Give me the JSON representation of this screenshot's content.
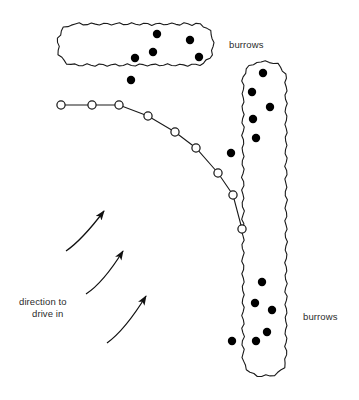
{
  "figure": {
    "title": "",
    "type": "schematic-map-diagram",
    "width": 359,
    "height": 400,
    "background_color": "#ffffff",
    "stroke_color": "#1a1a1a",
    "dot_fill_color": "#000000",
    "open_marker_fill": "#ffffff"
  },
  "labels": [
    {
      "id": "burrows-top",
      "text": "burrows",
      "x": 229,
      "y": 39,
      "align": "left"
    },
    {
      "id": "burrows-bottom",
      "text": "burrows",
      "x": 303,
      "y": 311,
      "align": "left"
    },
    {
      "id": "direction-line-1",
      "text": "direction to",
      "x": 19,
      "y": 296,
      "align": "left"
    },
    {
      "id": "direction-line-2",
      "text": "drive in",
      "x": 32,
      "y": 308,
      "align": "left"
    }
  ],
  "patches": [
    {
      "id": "burrow-patch-top",
      "name": "top-burrow-patch",
      "shape": "horizontal-rounded-blob",
      "wavy_outline": true,
      "bounds": {
        "x": 58,
        "y": 24,
        "w": 155,
        "h": 41
      }
    },
    {
      "id": "burrow-patch-right",
      "name": "right-burrow-patch",
      "shape": "vertical-rounded-blob",
      "wavy_outline": true,
      "bounds": {
        "x": 243,
        "y": 62,
        "w": 43,
        "h": 314
      }
    }
  ],
  "burrow_dots": {
    "radius": 4.2,
    "top_patch": [
      {
        "x": 157,
        "y": 34
      },
      {
        "x": 190,
        "y": 40
      },
      {
        "x": 153,
        "y": 52
      },
      {
        "x": 135,
        "y": 58
      },
      {
        "x": 199,
        "y": 57
      }
    ],
    "outside_top_patch": [
      {
        "x": 131,
        "y": 80
      }
    ],
    "right_patch_upper": [
      {
        "x": 263,
        "y": 73
      },
      {
        "x": 252,
        "y": 92
      },
      {
        "x": 270,
        "y": 107
      },
      {
        "x": 253,
        "y": 119
      },
      {
        "x": 256,
        "y": 138
      }
    ],
    "outside_right_patch": [
      {
        "x": 231,
        "y": 153
      },
      {
        "x": 232,
        "y": 341
      }
    ],
    "right_patch_lower": [
      {
        "x": 262,
        "y": 282
      },
      {
        "x": 255,
        "y": 303
      },
      {
        "x": 272,
        "y": 310
      },
      {
        "x": 267,
        "y": 332
      },
      {
        "x": 256,
        "y": 341
      }
    ]
  },
  "transect_line": {
    "id": "transect-with-open-markers",
    "marker_radius": 4.1,
    "marker_fill": "#ffffff",
    "points": [
      {
        "x": 61,
        "y": 105
      },
      {
        "x": 92,
        "y": 105
      },
      {
        "x": 119,
        "y": 105
      },
      {
        "x": 148,
        "y": 116
      },
      {
        "x": 175,
        "y": 132
      },
      {
        "x": 196,
        "y": 148
      },
      {
        "x": 218,
        "y": 173
      },
      {
        "x": 233,
        "y": 195
      },
      {
        "x": 242,
        "y": 229
      }
    ]
  },
  "direction_arrows": [
    {
      "id": "arrow-1",
      "from": {
        "x": 66,
        "y": 251
      },
      "ctrl": {
        "x": 82,
        "y": 240
      },
      "to": {
        "x": 104,
        "y": 211
      }
    },
    {
      "id": "arrow-2",
      "from": {
        "x": 86,
        "y": 294
      },
      "ctrl": {
        "x": 103,
        "y": 283
      },
      "to": {
        "x": 123,
        "y": 251
      }
    },
    {
      "id": "arrow-3",
      "from": {
        "x": 107,
        "y": 343
      },
      "ctrl": {
        "x": 125,
        "y": 330
      },
      "to": {
        "x": 146,
        "y": 296
      }
    }
  ]
}
